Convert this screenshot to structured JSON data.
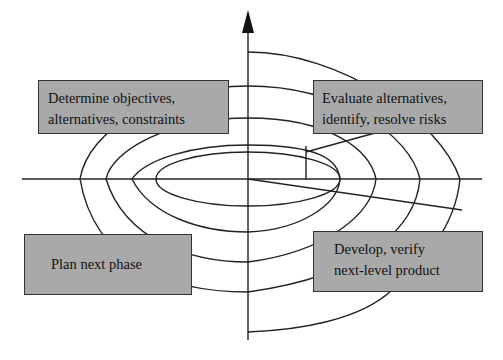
{
  "diagram": {
    "type": "spiral-model",
    "quadrants": {
      "top_left": {
        "lines": [
          "Determine objectives,",
          "alternatives, constraints"
        ]
      },
      "top_right": {
        "lines": [
          "Evaluate alternatives,",
          "identify, resolve risks"
        ]
      },
      "bottom_left": {
        "lines": [
          "Plan next phase"
        ]
      },
      "bottom_right": {
        "lines": [
          "Develop, verify",
          "next-level product"
        ]
      }
    },
    "colors": {
      "line": "#222222",
      "box_fill": "#a9a9a9",
      "background": "#ffffff"
    }
  }
}
